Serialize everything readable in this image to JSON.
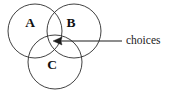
{
  "figure": {
    "kind": "venn-diagram",
    "background_color": "#ffffff",
    "stroke_color": "#2b2b2b",
    "text_color": "#111111"
  },
  "sets": [
    {
      "id": "A",
      "label": "A",
      "label_x": 30,
      "label_y": 24,
      "cx": 35,
      "cy": 31,
      "r": 27
    },
    {
      "id": "B",
      "label": "B",
      "label_x": 71,
      "label_y": 24,
      "cx": 74,
      "cy": 31,
      "r": 27
    },
    {
      "id": "C",
      "label": "C",
      "label_x": 52,
      "label_y": 66,
      "cx": 55,
      "cy": 62,
      "r": 27
    }
  ],
  "annotation": {
    "label": "choices",
    "label_x": 126,
    "label_y": 41,
    "line_start_x": 58,
    "line_end_x": 122,
    "line_y": 41,
    "arrow_tip_x": 53,
    "arrow_tip_y": 41,
    "arrow_color": "#1d1d1d",
    "points_to": "A ∩ B ∩ C"
  }
}
